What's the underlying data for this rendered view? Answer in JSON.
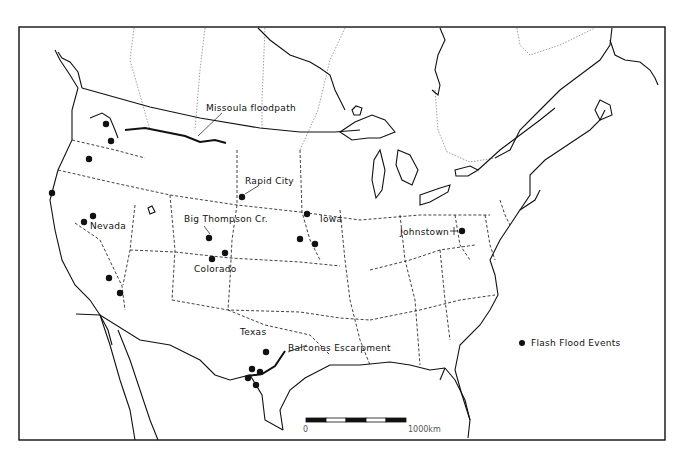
{
  "map": {
    "title": "Flash flood events in the conterminous United States",
    "labels": {
      "missoula": "Missoula floodpath",
      "rapid_city": "Rapid City",
      "big_thompson": "Big Thompson Cr.",
      "nevada": "Nevada",
      "colorado": "Colorado",
      "iowa": "Iowa",
      "johnstown": "Johnstown",
      "texas": "Texas",
      "balcones": "Balcones Escarpment"
    },
    "legend": {
      "marker": "filled-circle",
      "label": "Flash Flood Events"
    },
    "scale_bar": {
      "start_label": "0",
      "end_label": "1000km",
      "segments": 5
    },
    "colors": {
      "ink": "#111111",
      "background": "#ffffff",
      "border_dotted": "#888888"
    },
    "flood_events": [
      {
        "x": 106,
        "y": 124
      },
      {
        "x": 111,
        "y": 141
      },
      {
        "x": 89,
        "y": 159
      },
      {
        "x": 52,
        "y": 193
      },
      {
        "x": 93,
        "y": 216
      },
      {
        "x": 84,
        "y": 222
      },
      {
        "x": 109,
        "y": 278
      },
      {
        "x": 120,
        "y": 293
      },
      {
        "x": 242,
        "y": 197
      },
      {
        "x": 209,
        "y": 238
      },
      {
        "x": 225,
        "y": 253
      },
      {
        "x": 212,
        "y": 259
      },
      {
        "x": 307,
        "y": 214
      },
      {
        "x": 300,
        "y": 239
      },
      {
        "x": 315,
        "y": 244
      },
      {
        "x": 462,
        "y": 231
      },
      {
        "x": 266,
        "y": 352
      },
      {
        "x": 252,
        "y": 369
      },
      {
        "x": 260,
        "y": 372
      },
      {
        "x": 248,
        "y": 378
      },
      {
        "x": 256,
        "y": 385
      }
    ]
  }
}
